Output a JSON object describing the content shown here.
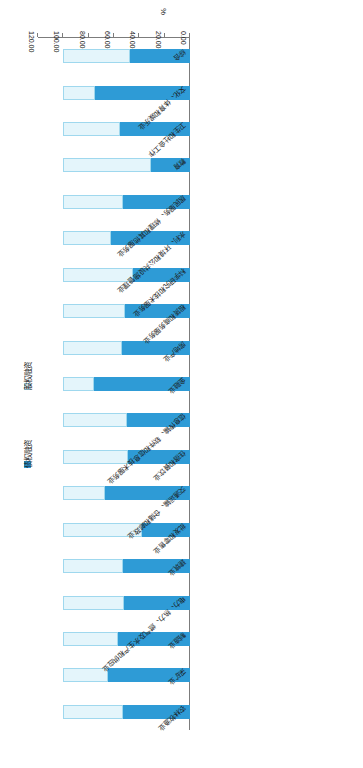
{
  "chart_data": {
    "type": "bar",
    "orientation": "horizontal-stacked",
    "title": "",
    "xlabel": "%",
    "ylabel": "",
    "xlim": [
      0,
      120
    ],
    "xticks": [
      "0.00",
      "20.00",
      "40.00",
      "60.00",
      "80.00",
      "100.00",
      "120.00"
    ],
    "grid": false,
    "legend_position": "right",
    "stacked_total": 100,
    "categories": [
      "农林牧渔业",
      "采矿业",
      "制造业",
      "电力、热力、燃气及水生产和供应业",
      "建筑业",
      "批发和零售业",
      "交通运输、仓储和邮政业",
      "住宿和餐饮业",
      "信息传输、软件和信息技术服务业",
      "金融业",
      "房地产业",
      "租赁和商务服务业",
      "科学研究和技术服务业",
      "水利、环境和公共设施管理业",
      "居民服务、修理和其他服务业",
      "教育",
      "卫生和社会工作",
      "文化、体育和娱乐业",
      "综合"
    ],
    "series": [
      {
        "name": "债权融资",
        "color": "#2e9bd6",
        "values": [
          53,
          65,
          57,
          52,
          53,
          38,
          67,
          49,
          50,
          76,
          54,
          51,
          45,
          62,
          53,
          31,
          55,
          75,
          47
        ]
      },
      {
        "name": "股权融资",
        "color": "#e4f5fb",
        "values": [
          47,
          35,
          43,
          48,
          47,
          62,
          33,
          51,
          50,
          24,
          46,
          49,
          55,
          38,
          47,
          69,
          45,
          25,
          53
        ]
      }
    ]
  },
  "legend": {
    "items": [
      {
        "label": "债权融资",
        "swatch": "filled-blue-swatch"
      },
      {
        "label": "股权融资",
        "swatch": "outlined-light-swatch"
      }
    ]
  },
  "axis": {
    "unit": "%"
  }
}
